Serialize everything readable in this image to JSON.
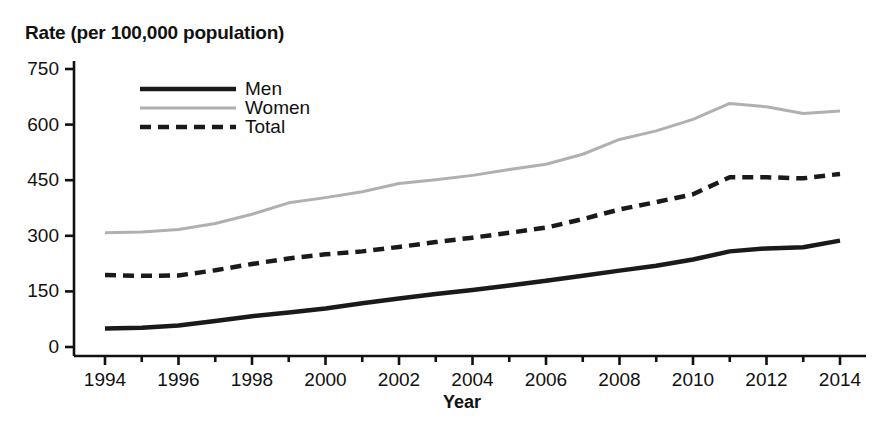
{
  "chart_data": {
    "type": "line",
    "title": "",
    "ylabel": "Rate (per 100,000 population)",
    "xlabel": "Year",
    "xlim": [
      1994,
      2014
    ],
    "ylim": [
      0,
      750
    ],
    "yticks": [
      0,
      150,
      300,
      450,
      600,
      750
    ],
    "ytick_labels": [
      "0",
      "150",
      "300",
      "450",
      "600",
      "750"
    ],
    "xticks": [
      1994,
      1996,
      1998,
      2000,
      2002,
      2004,
      2006,
      2008,
      2010,
      2012,
      2014
    ],
    "xtick_labels": [
      "1994",
      "1996",
      "1998",
      "2000",
      "2002",
      "2004",
      "2006",
      "2008",
      "2010",
      "2012",
      "2014"
    ],
    "minor_xticks_every": 1,
    "grid": false,
    "legend_position": "upper-left-inside",
    "x": [
      1994,
      1995,
      1996,
      1997,
      1998,
      1999,
      2000,
      2001,
      2002,
      2003,
      2004,
      2005,
      2006,
      2007,
      2008,
      2009,
      2010,
      2011,
      2012,
      2013,
      2014
    ],
    "series": [
      {
        "name": "Men",
        "style": "solid",
        "color": "#1a1a1a",
        "width": 4.5,
        "values": [
          50,
          52,
          58,
          70,
          83,
          93,
          104,
          118,
          131,
          143,
          154,
          166,
          179,
          192,
          206,
          219,
          236,
          258,
          266,
          269,
          287
        ]
      },
      {
        "name": "Women",
        "style": "solid",
        "color": "#b0b0b0",
        "width": 3,
        "values": [
          308,
          310,
          317,
          333,
          358,
          389,
          403,
          419,
          441,
          451,
          463,
          479,
          493,
          520,
          560,
          583,
          614,
          657,
          648,
          630,
          637
        ]
      },
      {
        "name": "Total",
        "style": "dashed",
        "color": "#1a1a1a",
        "width": 4.5,
        "values": [
          194,
          192,
          193,
          207,
          224,
          239,
          250,
          258,
          270,
          283,
          295,
          308,
          322,
          345,
          371,
          391,
          412,
          458,
          458,
          455,
          467
        ]
      }
    ]
  },
  "legend": {
    "items": [
      {
        "label": "Men"
      },
      {
        "label": "Women"
      },
      {
        "label": "Total"
      }
    ]
  },
  "axes": {
    "y_title": "Rate (per 100,000 population)",
    "x_title": "Year"
  }
}
